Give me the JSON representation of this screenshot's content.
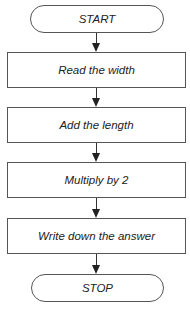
{
  "flowchart": {
    "start": {
      "label": "START"
    },
    "steps": [
      {
        "label": "Read the width"
      },
      {
        "label": "Add the length"
      },
      {
        "label": "Multiply by 2"
      },
      {
        "label": "Write down the answer"
      }
    ],
    "stop": {
      "label": "STOP"
    }
  }
}
